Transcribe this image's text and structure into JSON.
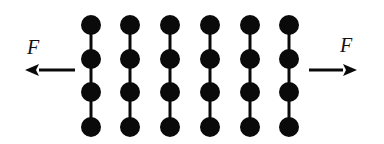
{
  "diagram": {
    "columns_x": [
      91,
      130,
      170,
      210,
      250,
      289
    ],
    "rows_y": [
      25,
      59,
      92,
      127
    ],
    "particle_radius": 10,
    "color": "#0a0a0a",
    "left_force": {
      "label": "F",
      "direction": "left",
      "x1": 75,
      "x2": 25,
      "y": 70,
      "label_x": 27,
      "label_y": 36
    },
    "right_force": {
      "label": "F",
      "direction": "right",
      "x1": 309,
      "x2": 357,
      "y": 70,
      "label_x": 340,
      "label_y": 34
    }
  }
}
